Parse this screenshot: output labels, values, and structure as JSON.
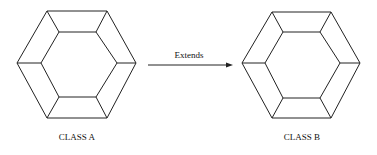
{
  "diagram": {
    "class_a": {
      "label": "CLASS A"
    },
    "class_b": {
      "label": "CLASS B"
    },
    "relation": {
      "label": "Extends",
      "from": "CLASS A",
      "to": "CLASS B"
    }
  }
}
